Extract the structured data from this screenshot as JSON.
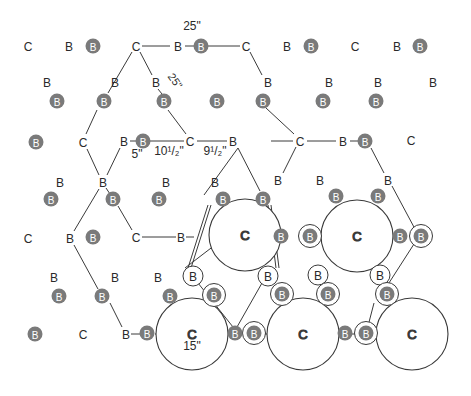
{
  "diagram": {
    "colors": {
      "line": "#3a3a3a",
      "filled_node": "#7a7a7a",
      "filled_node_text": "#ffffff",
      "text": "#2a2a2a",
      "background": "#ffffff"
    },
    "labels": {
      "dim_25_top": "25\"",
      "dim_25_diag": "25\"",
      "dim_5": "5\"",
      "dim_10_5": "10¹/₂\"",
      "dim_9_5": "9¹/₂\"",
      "dim_15": "15\""
    },
    "node_letters": {
      "c": "C",
      "b": "B"
    },
    "plain_c": [
      [
        28,
        46
      ],
      [
        136,
        46
      ],
      [
        246,
        46
      ],
      [
        355,
        46
      ],
      [
        83,
        142
      ],
      [
        190,
        141
      ],
      [
        300,
        141
      ],
      [
        411,
        140
      ],
      [
        28,
        238
      ],
      [
        136,
        237
      ],
      [
        83,
        334
      ]
    ],
    "plain_b": [
      [
        69,
        46
      ],
      [
        178,
        46
      ],
      [
        287,
        46
      ],
      [
        397,
        46
      ],
      [
        47,
        82
      ],
      [
        115,
        82
      ],
      [
        156,
        82
      ],
      [
        268,
        82
      ],
      [
        329,
        82
      ],
      [
        378,
        82
      ],
      [
        433,
        82
      ],
      [
        124,
        141
      ],
      [
        233,
        141
      ],
      [
        343,
        141
      ],
      [
        60,
        182
      ],
      [
        103,
        182
      ],
      [
        166,
        182
      ],
      [
        215,
        182
      ],
      [
        278,
        180
      ],
      [
        320,
        180
      ],
      [
        388,
        180
      ],
      [
        70,
        238
      ],
      [
        181,
        237
      ],
      [
        54,
        277
      ],
      [
        115,
        277
      ],
      [
        158,
        277
      ],
      [
        126,
        334
      ]
    ],
    "filled_b": [
      [
        93,
        46
      ],
      [
        201,
        46
      ],
      [
        311,
        46
      ],
      [
        420,
        46
      ],
      [
        57,
        101
      ],
      [
        104,
        101
      ],
      [
        164,
        101
      ],
      [
        217,
        101
      ],
      [
        263,
        101
      ],
      [
        323,
        101
      ],
      [
        376,
        101
      ],
      [
        143,
        141
      ],
      [
        365,
        141
      ],
      [
        36,
        142
      ],
      [
        51,
        199
      ],
      [
        113,
        199
      ],
      [
        159,
        199
      ],
      [
        223,
        199
      ],
      [
        263,
        199
      ],
      [
        336,
        196
      ],
      [
        378,
        196
      ],
      [
        93,
        237
      ],
      [
        281,
        236
      ],
      [
        400,
        236
      ],
      [
        59,
        296
      ],
      [
        102,
        296
      ],
      [
        170,
        296
      ],
      [
        35,
        334
      ],
      [
        147,
        333
      ],
      [
        235,
        333
      ],
      [
        345,
        333
      ]
    ],
    "ringed_b": [
      [
        310,
        236
      ],
      [
        421,
        236
      ],
      [
        214,
        295
      ],
      [
        282,
        294
      ],
      [
        328,
        294
      ],
      [
        387,
        294
      ],
      [
        254,
        333
      ],
      [
        366,
        333
      ]
    ],
    "open_b": [
      [
        193,
        276
      ],
      [
        268,
        276
      ],
      [
        318,
        275
      ],
      [
        380,
        275
      ]
    ],
    "big_circles": [
      {
        "cx": 245,
        "cy": 235,
        "r": 36,
        "label": "C"
      },
      {
        "cx": 357,
        "cy": 236,
        "r": 36,
        "label": "C"
      },
      {
        "cx": 192,
        "cy": 334,
        "r": 36,
        "label": "C"
      },
      {
        "cx": 303,
        "cy": 334,
        "r": 36,
        "label": "C"
      },
      {
        "cx": 412,
        "cy": 334,
        "r": 36,
        "label": "C"
      }
    ]
  }
}
